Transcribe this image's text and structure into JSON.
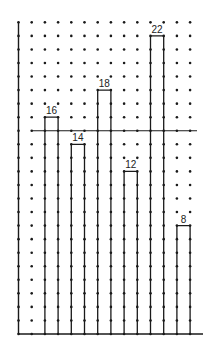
{
  "chart_data": {
    "type": "bar",
    "title": "",
    "xlabel": "",
    "ylabel": "",
    "categories": [
      "1",
      "2",
      "3",
      "4",
      "5",
      "6"
    ],
    "values": [
      16,
      14,
      18,
      12,
      22,
      8
    ],
    "data_labels": [
      "16",
      "14",
      "18",
      "12",
      "22",
      "8"
    ],
    "ylim": [
      0,
      23
    ],
    "grid": "dot-grid",
    "legend": "none",
    "reference_line": {
      "value": 15,
      "label": ""
    },
    "colors": {
      "stroke": "#1a1a1a",
      "dots": "#1a1a1a",
      "background": "#ffffff"
    }
  }
}
